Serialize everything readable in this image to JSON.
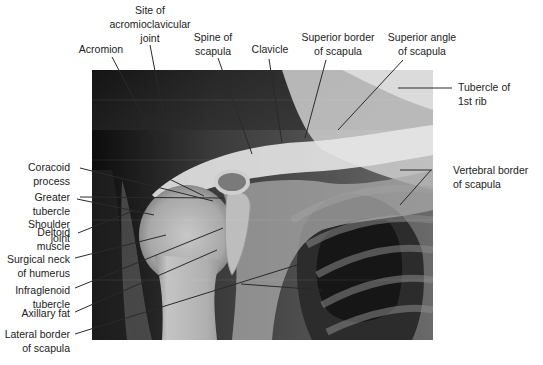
{
  "figure": {
    "labels_top": [
      {
        "id": "acromion",
        "text": "Acromion"
      },
      {
        "id": "ac-joint",
        "text": "Site of\nacromioclavicular\njoint"
      },
      {
        "id": "spine-scapula",
        "text": "Spine of\nscapula"
      },
      {
        "id": "clavicle",
        "text": "Clavicle"
      },
      {
        "id": "superior-border",
        "text": "Superior border\nof scapula"
      },
      {
        "id": "superior-angle",
        "text": "Superior angle\nof scapula"
      }
    ],
    "labels_right": [
      {
        "id": "tubercle-1st-rib",
        "text": "Tubercle of\n1st rib"
      },
      {
        "id": "vertebral-border",
        "text": "Vertebral border\nof scapula"
      }
    ],
    "labels_left": [
      {
        "id": "coracoid",
        "text": "Coracoid\nprocess"
      },
      {
        "id": "greater-tubercle",
        "text": "Greater\ntubercle"
      },
      {
        "id": "shoulder-joint",
        "text": "Shoulder\njoint"
      },
      {
        "id": "deltoid",
        "text": "Deltoid\nmuscle"
      },
      {
        "id": "surgical-neck",
        "text": "Surgical neck\nof humerus"
      },
      {
        "id": "infraglenoid",
        "text": "Infraglenoid\ntubercle"
      },
      {
        "id": "axillary-fat",
        "text": "Axillary fat"
      },
      {
        "id": "lateral-border",
        "text": "Lateral border\nof scapula"
      }
    ]
  }
}
